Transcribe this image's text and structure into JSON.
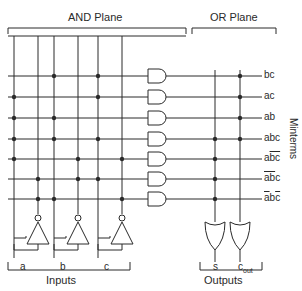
{
  "diagram": {
    "planes": {
      "and_plane": "AND Plane",
      "or_plane": "OR Plane"
    },
    "side_label": "Minterms",
    "inputs_label": "Inputs",
    "outputs_label": "Outputs",
    "inputs": [
      {
        "name": "a",
        "line_x": 14,
        "inv_x": 38
      },
      {
        "name": "b",
        "line_x": 54,
        "inv_x": 78
      },
      {
        "name": "c",
        "line_x": 98,
        "inv_x": 122
      }
    ],
    "outputs": [
      {
        "name": "s",
        "main": "s",
        "sub": ""
      },
      {
        "name": "cout",
        "main": "c",
        "sub": "out"
      }
    ],
    "minterms": [
      {
        "label": "bc",
        "parts": [
          {
            "t": "bc",
            "bar": false
          }
        ],
        "y": 80,
        "uses": {
          "b": 1,
          "c": 1
        },
        "to_s": false,
        "to_cout": true
      },
      {
        "label": "ac",
        "parts": [
          {
            "t": "ac",
            "bar": false
          }
        ],
        "y": 101,
        "uses": {
          "a": 1,
          "c": 1
        },
        "to_s": false,
        "to_cout": true
      },
      {
        "label": "ab",
        "parts": [
          {
            "t": "ab",
            "bar": false
          }
        ],
        "y": 122,
        "uses": {
          "a": 1,
          "b": 1
        },
        "to_s": false,
        "to_cout": true
      },
      {
        "label": "abc",
        "parts": [
          {
            "t": "abc",
            "bar": false
          }
        ],
        "y": 143,
        "uses": {
          "a": 1,
          "b": 1,
          "c": 1
        },
        "to_s": true,
        "to_cout": true
      },
      {
        "label": "a b̄ c̄",
        "parts": [
          {
            "t": "a",
            "bar": false
          },
          {
            "t": "bc",
            "bar": true
          }
        ],
        "y": 163,
        "uses": {
          "a": 1,
          "b": 0,
          "c": 0
        },
        "to_s": true,
        "to_cout": false
      },
      {
        "label": "ā b̄ c",
        "parts": [
          {
            "t": "ab",
            "bar": true
          },
          {
            "t": "c",
            "bar": false
          }
        ],
        "y": 183,
        "uses": {
          "a": 0,
          "b": 0,
          "c": 1
        },
        "to_s": true,
        "to_cout": false
      },
      {
        "label": "ā b c̄",
        "parts": [
          {
            "t": "a",
            "bar": true
          },
          {
            "t": "b",
            "bar": false
          },
          {
            "t": "c",
            "bar": true
          }
        ],
        "y": 203,
        "uses": {
          "a": 0,
          "b": 1,
          "c": 0
        },
        "to_s": true,
        "to_cout": false
      }
    ],
    "colors": {
      "line": "#2a2a2a",
      "background": "#ffffff"
    }
  }
}
